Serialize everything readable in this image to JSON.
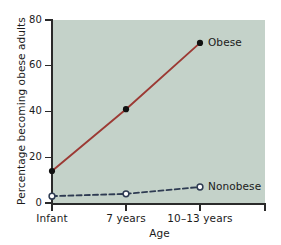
{
  "chart_data": {
    "type": "line",
    "title": "",
    "xlabel": "Age",
    "ylabel": "Percentage becoming obese adults",
    "categories": [
      "Infant",
      "7 years",
      "10–13 years"
    ],
    "ylim": [
      0,
      80
    ],
    "yticks": [
      0,
      20,
      40,
      60,
      80
    ],
    "ytick_labels": [
      "0",
      "20",
      "40",
      "60",
      "80"
    ],
    "grid": false,
    "legend_position": "inline-right-of-last-point",
    "series": [
      {
        "name": "Obese",
        "values": [
          14,
          41,
          70
        ],
        "color": "#9c3a34",
        "linestyle": "solid",
        "marker": "filled-circle",
        "marker_color": "#111111",
        "label": "Obese"
      },
      {
        "name": "Nonobese",
        "values": [
          3,
          4,
          7
        ],
        "color": "#2e3b52",
        "linestyle": "dashed",
        "marker": "open-circle",
        "marker_color": "#2e3b52",
        "label": "Nonobese"
      }
    ]
  },
  "figure": {
    "background": "#ffffff",
    "plot_background": "#c4d2c9",
    "axis_color": "#2a2a2a"
  }
}
